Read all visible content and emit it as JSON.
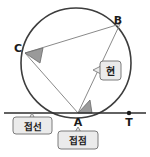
{
  "figure": {
    "background_color": "#ffffff",
    "stroke_color": "#4a4a4a",
    "circle_stroke_color": "#3d3d3d",
    "chord_stroke_color": "#8a8a8a",
    "angle_fill_color": "#9a9a9a",
    "callout_fill_color": "#ebebeb",
    "callout_border_color": "#6e6e6e",
    "text_color": "#1b1b1b"
  },
  "points": [
    {
      "id": "B",
      "label": "B",
      "x": 118,
      "y": 24
    },
    {
      "id": "C",
      "label": "C",
      "x": 18,
      "y": 52
    },
    {
      "id": "A",
      "label": "A",
      "x": 78,
      "y": 117
    },
    {
      "id": "T",
      "label": "T",
      "x": 129,
      "y": 118
    }
  ],
  "callouts": [
    {
      "id": "chord",
      "label": "현",
      "meaning": "chord",
      "x": 104,
      "y": 71
    },
    {
      "id": "tangent-line",
      "label": "접선",
      "meaning": "tangent line",
      "x": 32,
      "y": 126
    },
    {
      "id": "tangent-point",
      "label": "접점",
      "meaning": "point of tangency",
      "x": 78,
      "y": 140
    }
  ],
  "angles": [
    {
      "id": "inscribed-angle-at-C",
      "vertex": "C",
      "marked": true
    },
    {
      "id": "tangent-chord-angle-at-A",
      "vertex": "A",
      "marked": true
    }
  ],
  "segments": [
    {
      "id": "chord-CB",
      "from": "C",
      "to": "B"
    },
    {
      "id": "chord-CA",
      "from": "C",
      "to": "A"
    },
    {
      "id": "chord-AB",
      "from": "A",
      "to": "B"
    },
    {
      "id": "tangent-line-at-A",
      "from": "left-edge",
      "to": "right-edge"
    }
  ]
}
